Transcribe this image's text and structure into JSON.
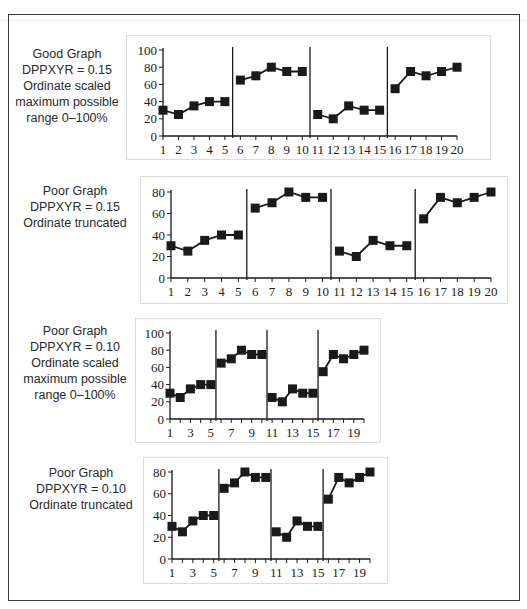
{
  "chart_data": [
    {
      "type": "line",
      "title": "Good Graph",
      "caption": [
        "Good Graph",
        "DPPXYR = 0.15",
        "Ordinate scaled",
        "maximum possible",
        "range 0–100%"
      ],
      "xlabel": "",
      "ylabel": "",
      "x": [
        1,
        2,
        3,
        4,
        5,
        6,
        7,
        8,
        9,
        10,
        11,
        12,
        13,
        14,
        15,
        16,
        17,
        18,
        19,
        20
      ],
      "x_tick_labels": [
        "1",
        "2",
        "3",
        "4",
        "5",
        "6",
        "7",
        "8",
        "9",
        "10",
        "11",
        "12",
        "13",
        "14",
        "15",
        "16",
        "17",
        "18",
        "19",
        "20"
      ],
      "y_tick_labels": [
        "0",
        "20",
        "40",
        "60",
        "80",
        "100"
      ],
      "ylim": [
        0,
        100
      ],
      "phase_lines_after": [
        5,
        10,
        15
      ],
      "series": [
        {
          "name": "data",
          "values": [
            30,
            25,
            35,
            40,
            40,
            65,
            70,
            80,
            75,
            75,
            25,
            20,
            35,
            30,
            30,
            55,
            75,
            70,
            75,
            80
          ]
        }
      ],
      "grid": false,
      "legend": "none"
    },
    {
      "type": "line",
      "title": "Poor Graph",
      "caption": [
        "Poor Graph",
        "DPPXYR = 0.15",
        "Ordinate truncated"
      ],
      "xlabel": "",
      "ylabel": "",
      "x": [
        1,
        2,
        3,
        4,
        5,
        6,
        7,
        8,
        9,
        10,
        11,
        12,
        13,
        14,
        15,
        16,
        17,
        18,
        19,
        20
      ],
      "x_tick_labels": [
        "1",
        "2",
        "3",
        "4",
        "5",
        "6",
        "7",
        "8",
        "9",
        "10",
        "11",
        "12",
        "13",
        "14",
        "15",
        "16",
        "17",
        "18",
        "19",
        "20"
      ],
      "y_tick_labels": [
        "0",
        "20",
        "40",
        "60",
        "80"
      ],
      "ylim": [
        0,
        80
      ],
      "phase_lines_after": [
        5,
        10,
        15
      ],
      "series": [
        {
          "name": "data",
          "values": [
            30,
            25,
            35,
            40,
            40,
            65,
            70,
            80,
            75,
            75,
            25,
            20,
            35,
            30,
            30,
            55,
            75,
            70,
            75,
            80
          ]
        }
      ],
      "grid": false,
      "legend": "none"
    },
    {
      "type": "line",
      "title": "Poor Graph",
      "caption": [
        "Poor Graph",
        "DPPXYR = 0.10",
        "Ordinate scaled",
        "maximum possible",
        "range 0–100%"
      ],
      "xlabel": "",
      "ylabel": "",
      "x": [
        1,
        2,
        3,
        4,
        5,
        6,
        7,
        8,
        9,
        10,
        11,
        12,
        13,
        14,
        15,
        16,
        17,
        18,
        19,
        20
      ],
      "x_tick_labels": [
        "1",
        "3",
        "5",
        "7",
        "9",
        "11",
        "13",
        "15",
        "17",
        "19"
      ],
      "y_tick_labels": [
        "0",
        "20",
        "40",
        "60",
        "80",
        "100"
      ],
      "ylim": [
        0,
        100
      ],
      "phase_lines_after": [
        5,
        10,
        15
      ],
      "series": [
        {
          "name": "data",
          "values": [
            30,
            25,
            35,
            40,
            40,
            65,
            70,
            80,
            75,
            75,
            25,
            20,
            35,
            30,
            30,
            55,
            75,
            70,
            75,
            80
          ]
        }
      ],
      "grid": false,
      "legend": "none"
    },
    {
      "type": "line",
      "title": "Poor Graph",
      "caption": [
        "Poor Graph",
        "DPPXYR = 0.10",
        "Ordinate truncated"
      ],
      "xlabel": "",
      "ylabel": "",
      "x": [
        1,
        2,
        3,
        4,
        5,
        6,
        7,
        8,
        9,
        10,
        11,
        12,
        13,
        14,
        15,
        16,
        17,
        18,
        19,
        20
      ],
      "x_tick_labels": [
        "1",
        "3",
        "5",
        "7",
        "9",
        "11",
        "13",
        "15",
        "17",
        "19"
      ],
      "y_tick_labels": [
        "0",
        "20",
        "40",
        "60",
        "80"
      ],
      "ylim": [
        0,
        80
      ],
      "phase_lines_after": [
        5,
        10,
        15
      ],
      "series": [
        {
          "name": "data",
          "values": [
            30,
            25,
            35,
            40,
            40,
            65,
            70,
            80,
            75,
            75,
            25,
            20,
            35,
            30,
            30,
            55,
            75,
            70,
            75,
            80
          ]
        }
      ],
      "grid": false,
      "legend": "none"
    }
  ]
}
